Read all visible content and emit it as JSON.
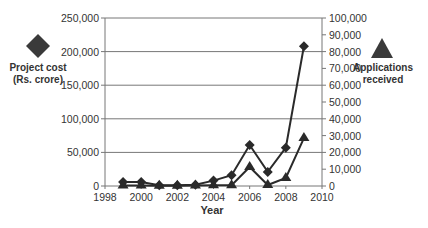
{
  "chart_data": {
    "type": "line",
    "title": "",
    "xlabel": "Year",
    "ylabel_left": "Project cost (Rs. crore)",
    "ylabel_right": "Applications received",
    "x": [
      1999,
      2000,
      2001,
      2002,
      2003,
      2004,
      2005,
      2006,
      2007,
      2008,
      2009
    ],
    "xlim": [
      1998,
      2010
    ],
    "x_ticks": [
      "1998",
      "2000",
      "2002",
      "2004",
      "2006",
      "2008",
      "2010"
    ],
    "series": [
      {
        "name": "Project cost (Rs. crore)",
        "axis": "left",
        "marker": "diamond",
        "values": [
          6000,
          6000,
          1000,
          1000,
          2000,
          8000,
          16000,
          61000,
          21000,
          57000,
          208000
        ]
      },
      {
        "name": "Applications received",
        "axis": "right",
        "marker": "triangle",
        "values": [
          300,
          300,
          200,
          200,
          300,
          500,
          500,
          11300,
          600,
          4800,
          28500
        ]
      }
    ],
    "ylim_left": [
      0,
      250000
    ],
    "ylim_right": [
      0,
      100000
    ],
    "y_ticks_left": [
      "0",
      "50,000",
      "100,000",
      "150,000",
      "200,000",
      "250,000"
    ],
    "y_ticks_right": [
      "0",
      "10,000",
      "20,000",
      "30,000",
      "40,000",
      "50,000",
      "60,000",
      "70,000",
      "80,000",
      "90,000",
      "100,000"
    ],
    "grid": "horizontal at left-axis ticks",
    "legend": [
      {
        "label_line1": "Project cost",
        "label_line2": "(Rs. crore)",
        "marker": "diamond",
        "position": "left"
      },
      {
        "label_line1": "Applications",
        "label_line2": "received",
        "marker": "triangle",
        "position": "right"
      }
    ],
    "colors": {
      "line": "#2a2a2a",
      "grid": "#777777",
      "axis": "#777777"
    }
  }
}
